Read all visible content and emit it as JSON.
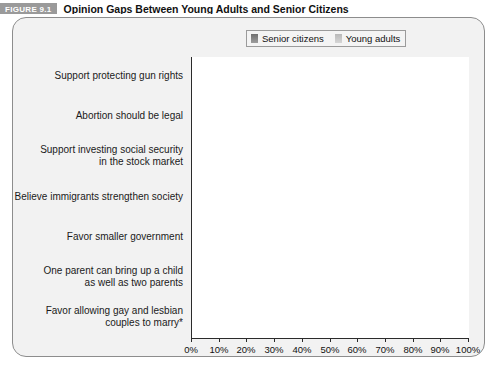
{
  "header": {
    "figure_tag": "FIGURE 9.1",
    "title": "Opinion Gaps Between Young Adults and Senior Citizens"
  },
  "legend": {
    "items": [
      {
        "label": "Senior citizens",
        "color": "#8a8a8a",
        "icon": "square-swatch-icon"
      },
      {
        "label": "Young adults",
        "color": "#c9c9c9",
        "icon": "square-swatch-icon"
      }
    ]
  },
  "chart_data": {
    "type": "bar",
    "orientation": "horizontal",
    "title": "Opinion Gaps Between Young Adults and Senior Citizens",
    "xlabel": "",
    "ylabel": "",
    "xlim": [
      0,
      100
    ],
    "xtick_labels": [
      "0%",
      "10%",
      "20%",
      "30%",
      "40%",
      "50%",
      "60%",
      "70%",
      "80%",
      "90%",
      "100%"
    ],
    "xticks": [
      0,
      10,
      20,
      30,
      40,
      50,
      60,
      70,
      80,
      90,
      100
    ],
    "grid": "vertical",
    "legend_position": "top-right",
    "categories": [
      "Support protecting gun rights",
      "Abortion should be legal",
      "Support investing social security\nin the stock market",
      "Believe immigrants strengthen society",
      "Favor smaller government",
      "One parent can bring up a child\nas well as two parents",
      "Favor allowing gay and lesbian\ncouples to marry*"
    ],
    "series": [
      {
        "name": "Senior citizens",
        "color": "#8a8a8a",
        "values": [
          48,
          48,
          45,
          40,
          59,
          36,
          31
        ]
      },
      {
        "name": "Young adults",
        "color": "#c9c9c9",
        "values": [
          42,
          52,
          88,
          68,
          43,
          65,
          65
        ]
      }
    ],
    "footnote": "*"
  }
}
